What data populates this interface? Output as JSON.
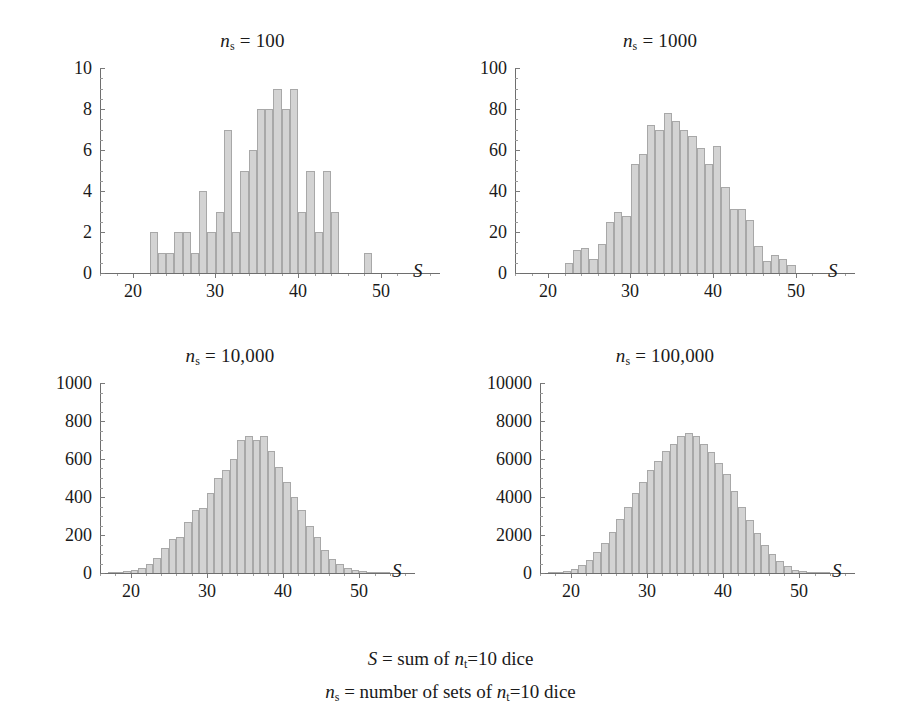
{
  "figure": {
    "background": "#ffffff",
    "bar_fill": "#d3d3d3",
    "bar_stroke": "#a8a8a8",
    "axis_color": "#6e6e6e"
  },
  "caption": {
    "line1_prefix": "S",
    "line1_mid": " = sum of ",
    "line1_var": "n",
    "line1_sub": "t",
    "line1_suffix": "=10 dice",
    "line2_var": "n",
    "line2_sub": "s",
    "line2_mid": " = number of sets of ",
    "line2_var2": "n",
    "line2_sub2": "t",
    "line2_suffix": "=10 dice"
  },
  "chart_data": [
    {
      "type": "bar",
      "title": "n_s = 100",
      "title_var": "n",
      "title_sub": "s",
      "title_value": " = 100",
      "xlabel": "S",
      "ylabel": "",
      "xlim": [
        16,
        56
      ],
      "ylim": [
        0,
        10
      ],
      "xticks": [
        20,
        30,
        40,
        50
      ],
      "xtick_labels": [
        "20",
        "30",
        "40",
        "50"
      ],
      "yticks": [
        0,
        2,
        4,
        6,
        8,
        10
      ],
      "ytick_labels": [
        "0",
        "2",
        "4",
        "6",
        "8",
        "10"
      ],
      "grid": false,
      "legend": "none",
      "categories": [
        22,
        23,
        24,
        25,
        26,
        27,
        28,
        29,
        30,
        31,
        32,
        33,
        34,
        35,
        36,
        37,
        38,
        39,
        40,
        41,
        42,
        43,
        44,
        48
      ],
      "values": [
        2,
        1,
        1,
        2,
        2,
        1,
        4,
        2,
        3,
        7,
        2,
        5,
        6,
        8,
        8,
        9,
        8,
        9,
        3,
        5,
        2,
        5,
        3,
        1
      ]
    },
    {
      "type": "bar",
      "title": "n_s = 1000",
      "title_var": "n",
      "title_sub": "s",
      "title_value": " = 1000",
      "xlabel": "S",
      "ylabel": "",
      "xlim": [
        16,
        56
      ],
      "ylim": [
        0,
        100
      ],
      "xticks": [
        20,
        30,
        40,
        50
      ],
      "xtick_labels": [
        "20",
        "30",
        "40",
        "50"
      ],
      "yticks": [
        0,
        20,
        40,
        60,
        80,
        100
      ],
      "ytick_labels": [
        "0",
        "20",
        "40",
        "60",
        "80",
        "100"
      ],
      "grid": false,
      "legend": "none",
      "categories": [
        22,
        23,
        24,
        25,
        26,
        27,
        28,
        29,
        30,
        31,
        32,
        33,
        34,
        35,
        36,
        37,
        38,
        39,
        40,
        41,
        42,
        43,
        44,
        45,
        46,
        47,
        48,
        49
      ],
      "values": [
        5,
        11,
        12,
        7,
        14,
        25,
        30,
        28,
        53,
        58,
        72,
        70,
        78,
        74,
        70,
        67,
        61,
        53,
        62,
        42,
        31,
        31,
        26,
        13,
        6,
        9,
        7,
        4
      ]
    },
    {
      "type": "bar",
      "title": "n_s = 10,000",
      "title_var": "n",
      "title_sub": "s",
      "title_value": " = 10,000",
      "xlabel": "S",
      "ylabel": "",
      "xlim": [
        16,
        56
      ],
      "ylim": [
        0,
        1000
      ],
      "xticks": [
        20,
        30,
        40,
        50
      ],
      "xtick_labels": [
        "20",
        "30",
        "40",
        "50"
      ],
      "yticks": [
        0,
        200,
        400,
        600,
        800,
        1000
      ],
      "ytick_labels": [
        "0",
        "200",
        "400",
        "600",
        "800",
        "1000"
      ],
      "grid": false,
      "legend": "none",
      "categories": [
        17,
        18,
        19,
        20,
        21,
        22,
        23,
        24,
        25,
        26,
        27,
        28,
        29,
        30,
        31,
        32,
        33,
        34,
        35,
        36,
        37,
        38,
        39,
        40,
        41,
        42,
        43,
        44,
        45,
        46,
        47,
        48,
        49,
        50,
        51,
        52,
        53
      ],
      "values": [
        2,
        4,
        8,
        15,
        28,
        50,
        80,
        130,
        180,
        190,
        270,
        330,
        340,
        420,
        500,
        540,
        600,
        700,
        720,
        700,
        720,
        640,
        560,
        480,
        400,
        330,
        250,
        190,
        120,
        75,
        45,
        28,
        15,
        8,
        4,
        2,
        1
      ]
    },
    {
      "type": "bar",
      "title": "n_s = 100,000",
      "title_var": "n",
      "title_sub": "s",
      "title_value": " = 100,000",
      "xlabel": "S",
      "ylabel": "",
      "xlim": [
        16,
        56
      ],
      "ylim": [
        0,
        10000
      ],
      "xticks": [
        20,
        30,
        40,
        50
      ],
      "xtick_labels": [
        "20",
        "30",
        "40",
        "50"
      ],
      "yticks": [
        0,
        2000,
        4000,
        6000,
        8000,
        10000
      ],
      "ytick_labels": [
        "0",
        "2000",
        "4000",
        "6000",
        "8000",
        "10000"
      ],
      "grid": false,
      "legend": "none",
      "categories": [
        17,
        18,
        19,
        20,
        21,
        22,
        23,
        24,
        25,
        26,
        27,
        28,
        29,
        30,
        31,
        32,
        33,
        34,
        35,
        36,
        37,
        38,
        39,
        40,
        41,
        42,
        43,
        44,
        45,
        46,
        47,
        48,
        49,
        50,
        51,
        52,
        53
      ],
      "values": [
        20,
        50,
        110,
        230,
        420,
        700,
        1080,
        1560,
        2150,
        2820,
        3480,
        4200,
        4800,
        5400,
        5900,
        6400,
        6800,
        7200,
        7350,
        7200,
        6800,
        6350,
        5800,
        5200,
        4300,
        3500,
        2800,
        2100,
        1500,
        1000,
        620,
        350,
        180,
        90,
        40,
        15,
        5
      ]
    }
  ]
}
